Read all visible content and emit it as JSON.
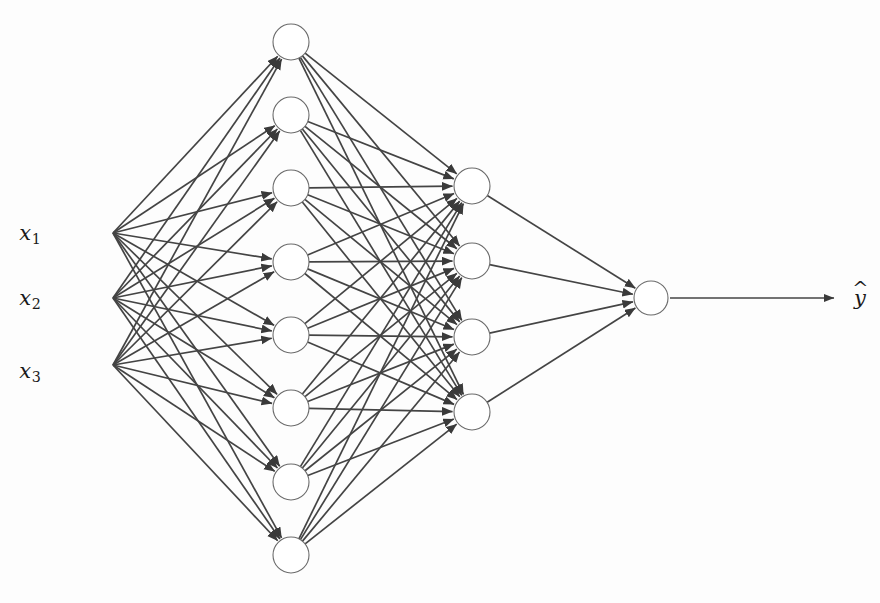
{
  "figure": {
    "type": "neural-network-diagram",
    "title": "",
    "background_color": "#fdfdfd",
    "edge_color": "#444444",
    "node_stroke_color": "#6b6b6b",
    "node_fill_color": "#ffffff",
    "text_color": "#1a1a1a"
  },
  "inputs": [
    {
      "id": "x1",
      "base": "x",
      "sub": "1",
      "x": 113,
      "y": 233,
      "label_x": 30,
      "label_y": 235
    },
    {
      "id": "x2",
      "base": "x",
      "sub": "2",
      "x": 113,
      "y": 298,
      "label_x": 30,
      "label_y": 300
    },
    {
      "id": "x3",
      "base": "x",
      "sub": "3",
      "x": 113,
      "y": 365,
      "label_x": 30,
      "label_y": 373
    }
  ],
  "output": {
    "id": "yhat",
    "base": "y",
    "hat": "^",
    "label_x": 860,
    "label_y": 298,
    "arrow_start_x": 670,
    "arrow_end_x": 834,
    "arrow_y": 298
  },
  "layers": [
    {
      "name": "hidden-layer-1",
      "count": 8,
      "cx": 291,
      "radius": 18,
      "nodes_y": [
        42,
        115,
        188,
        262,
        335,
        408,
        482,
        555
      ]
    },
    {
      "name": "hidden-layer-2",
      "count": 4,
      "cx": 472,
      "radius": 18,
      "nodes_y": [
        186,
        261,
        337,
        412
      ]
    },
    {
      "name": "output-layer",
      "count": 1,
      "cx": 651,
      "radius": 17,
      "nodes_y": [
        298
      ]
    }
  ],
  "chart_data": {
    "type": "diagram",
    "architecture": [
      3,
      8,
      4,
      1
    ],
    "layer_names": [
      "input",
      "hidden-1",
      "hidden-2",
      "output"
    ],
    "input_labels": [
      "x1",
      "x2",
      "x3"
    ],
    "output_labels": [
      "y-hat"
    ],
    "edge_counts": [
      24,
      32,
      4
    ],
    "total_edges": 60,
    "directed": true,
    "fully_connected": true
  }
}
